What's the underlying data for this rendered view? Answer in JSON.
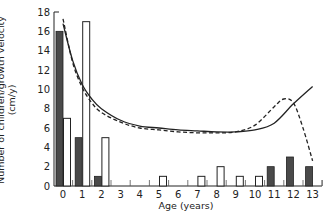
{
  "chart_data": {
    "type": "bar",
    "title": "",
    "xlabel": "Age (years)",
    "ylabel": "Number of children/growth velocity (cm/y)",
    "ylabel_line1": "Number of children/growth velocity",
    "ylabel_line2": "(cm/y)",
    "xlim": [
      0,
      13
    ],
    "ylim": [
      0,
      18
    ],
    "yticks": [
      0,
      2,
      4,
      6,
      8,
      10,
      12,
      14,
      16,
      18
    ],
    "xticks": [
      0,
      1,
      2,
      3,
      4,
      5,
      6,
      7,
      8,
      9,
      10,
      11,
      12,
      13
    ],
    "grid": false,
    "legend": null,
    "categories": [
      "0",
      "1",
      "2",
      "3",
      "4",
      "5",
      "6",
      "7",
      "8",
      "9",
      "10",
      "11",
      "12",
      "13"
    ],
    "series": [
      {
        "name": "Filled bars (children)",
        "style": "filled",
        "color": "#4a4a4a",
        "values": [
          16,
          5,
          1,
          0,
          0,
          0,
          0,
          0,
          0,
          0,
          0,
          2,
          3,
          2
        ]
      },
      {
        "name": "Open bars (children)",
        "style": "open",
        "color": "#ffffff",
        "values": [
          7,
          17,
          5,
          0,
          0,
          1,
          0,
          1,
          2,
          1,
          1,
          0,
          0,
          0
        ]
      }
    ],
    "curves": [
      {
        "name": "Growth velocity (solid)",
        "style": "solid",
        "x": [
          0,
          0.5,
          1,
          1.5,
          2,
          3,
          4,
          5,
          6,
          7,
          8,
          9,
          10,
          11,
          12,
          13
        ],
        "y": [
          16.8,
          13,
          10.5,
          9,
          8,
          6.8,
          6.2,
          6.0,
          5.8,
          5.7,
          5.6,
          5.6,
          5.8,
          6.5,
          8.5,
          10.3
        ]
      },
      {
        "name": "Growth velocity (dashed)",
        "style": "dashed",
        "x": [
          0,
          0.5,
          1,
          1.5,
          2,
          3,
          4,
          5,
          6,
          7,
          8,
          9,
          10,
          11,
          11.5,
          12,
          12.5,
          13
        ],
        "y": [
          17.3,
          12.8,
          10.2,
          8.6,
          7.6,
          6.6,
          6.0,
          5.8,
          5.6,
          5.5,
          5.5,
          5.6,
          6.3,
          8.2,
          9.0,
          8.6,
          6.0,
          2.6
        ]
      }
    ]
  },
  "caption_fragment": "· · · · · · · · ·"
}
